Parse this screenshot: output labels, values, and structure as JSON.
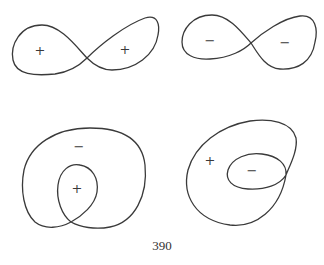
{
  "figures": [
    {
      "id": "figure-eight-positive",
      "shape": "figure-eight (lemniscate) with two lobes",
      "labels": [
        "+",
        "+"
      ]
    },
    {
      "id": "figure-eight-negative",
      "shape": "figure-eight (lemniscate) with two lobes",
      "labels": [
        "−",
        "−"
      ]
    },
    {
      "id": "inner-loop-positive",
      "shape": "large loop containing a smaller inner loop (limaçon-like)",
      "labels": [
        "−",
        "+"
      ]
    },
    {
      "id": "inner-loop-negative",
      "shape": "large loop containing a smaller inner loop (limaçon-like)",
      "labels": [
        "+",
        "−"
      ]
    }
  ],
  "page_number": "390",
  "colors": {
    "stroke": "#3a3a3a",
    "background": "#ffffff"
  }
}
